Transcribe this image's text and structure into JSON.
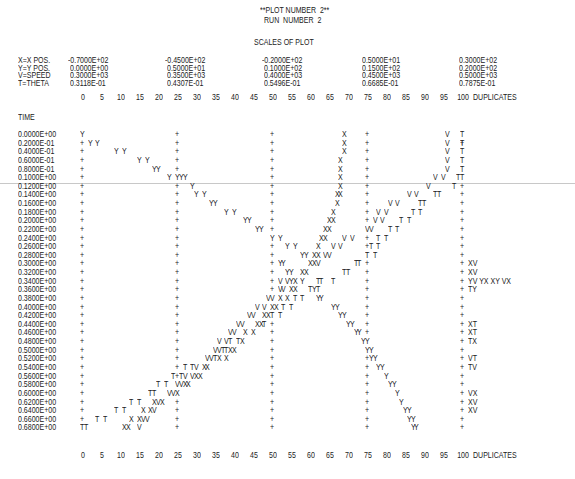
{
  "header": {
    "plot_number": "**PLOT NUMBER  2**",
    "run_number": "RUN  NUMBER  2",
    "scales_title": "SCALES OF PLOT"
  },
  "scales": {
    "variables": [
      "X=X POS.",
      "Y=Y POS.",
      "V=SPEED",
      "T=THETA"
    ],
    "columns": [
      [
        "-0.7000E+02",
        "0.0000E+00",
        "0.3000E+03",
        "0.3118E-01"
      ],
      [
        "-0.4500E+02",
        "0.5000E+01",
        "0.3500E+03",
        "0.4307E-01"
      ],
      [
        "-0.2000E+02",
        "0.1000E+02",
        "0.4000E+03",
        "0.5496E-01"
      ],
      [
        "0.5000E+01",
        "0.1500E+02",
        "0.4500E+03",
        "0.6685E-01"
      ],
      [
        "0.3000E+02",
        "0.2000E+02",
        "0.5000E+03",
        "0.7875E-01"
      ]
    ]
  },
  "axis": {
    "ticks": [
      "0",
      "5",
      "10",
      "15",
      "20",
      "25",
      "30",
      "35",
      "40",
      "45",
      "50",
      "55",
      "60",
      "65",
      "70",
      "75",
      "80",
      "85",
      "90",
      "95",
      "100"
    ],
    "duplicates_label": "DUPLICATES",
    "time_label": "TIME"
  },
  "chart_data": {
    "type": "scatter",
    "xlabel": "plot column (0-100)",
    "ylabel": "TIME",
    "xlim": [
      0,
      100
    ],
    "ylim": [
      0.0,
      0.68
    ],
    "grid_columns": [
      0,
      25,
      50,
      75,
      100
    ],
    "legend": [
      "X=X POS.",
      "Y=Y POS.",
      "V=SPEED",
      "T=THETA"
    ],
    "rows": [
      {
        "time": "0.0000E+00",
        "marks": [
          [
            0,
            "Y"
          ],
          [
            69,
            "X"
          ],
          [
            96,
            "V"
          ],
          [
            100,
            "T"
          ]
        ],
        "dup": ""
      },
      {
        "time": "0.2000E-01",
        "marks": [
          [
            2,
            "Y"
          ],
          [
            4,
            "Y"
          ]
        ],
        "x": 69,
        "v": 96,
        "t": 100,
        "dup": ""
      },
      {
        "time": "0.4000E-01",
        "marks": [
          [
            9,
            "Y"
          ],
          [
            11,
            "Y"
          ],
          [
            69,
            "X"
          ],
          [
            96,
            "V"
          ],
          [
            100,
            "T"
          ]
        ],
        "dup": ""
      },
      {
        "time": "0.6000E-01",
        "marks": [
          [
            15,
            "Y"
          ],
          [
            17,
            "Y"
          ],
          [
            68,
            "X"
          ],
          [
            96,
            "V"
          ],
          [
            100,
            "T"
          ]
        ],
        "dup": ""
      },
      {
        "time": "0.8000E-01",
        "marks": [
          [
            19,
            "YY"
          ],
          [
            68,
            "X"
          ],
          [
            96,
            "V"
          ],
          [
            100,
            "T"
          ]
        ],
        "dup": ""
      },
      {
        "time": "0.1000E+00",
        "marks": [
          [
            23,
            "Y"
          ],
          [
            25,
            "YYY"
          ],
          [
            68,
            "X"
          ],
          [
            93,
            "V"
          ],
          [
            95,
            "V"
          ],
          [
            99,
            "TT"
          ]
        ],
        "dup": ""
      },
      {
        "time": "0.1200E+00",
        "marks": [
          [
            29,
            "Y"
          ],
          [
            68,
            "X"
          ],
          [
            91,
            "V"
          ],
          [
            98,
            "T"
          ]
        ],
        "dup": ""
      },
      {
        "time": "0.1400E+00",
        "marks": [
          [
            30,
            "Y"
          ],
          [
            32,
            "Y"
          ],
          [
            67,
            "XX"
          ],
          [
            86,
            "V"
          ],
          [
            88,
            "V"
          ],
          [
            93,
            "TT"
          ]
        ],
        "dup": ""
      },
      {
        "time": "0.1600E+00",
        "marks": [
          [
            34,
            "YY"
          ],
          [
            67,
            "X"
          ],
          [
            81,
            "V"
          ],
          [
            83,
            "V"
          ],
          [
            89,
            "TT"
          ]
        ],
        "dup": ""
      },
      {
        "time": "0.1800E+00",
        "marks": [
          [
            38,
            "Y"
          ],
          [
            40,
            "Y"
          ],
          [
            66,
            "X"
          ],
          [
            78,
            "V"
          ],
          [
            80,
            "V"
          ],
          [
            87,
            "T"
          ],
          [
            89,
            "T"
          ]
        ],
        "dup": ""
      },
      {
        "time": "0.2000E+00",
        "marks": [
          [
            43,
            "YY"
          ],
          [
            65,
            "XX"
          ],
          [
            77,
            "V"
          ],
          [
            79,
            "V"
          ],
          [
            84,
            "T"
          ],
          [
            86,
            "T"
          ]
        ],
        "dup": ""
      },
      {
        "time": "0.2200E+00",
        "marks": [
          [
            46,
            "YY"
          ],
          [
            64,
            "XX"
          ],
          [
            75,
            "VV"
          ],
          [
            81,
            "T"
          ],
          [
            83,
            "T"
          ]
        ],
        "dup": ""
      },
      {
        "time": "0.2400E+00",
        "marks": [
          [
            50,
            "Y"
          ],
          [
            52,
            "Y"
          ],
          [
            63,
            "XX"
          ],
          [
            69,
            "V"
          ],
          [
            71,
            "V"
          ],
          [
            78,
            "T"
          ],
          [
            80,
            "T"
          ]
        ],
        "dup": ""
      },
      {
        "time": "0.2600E+00",
        "marks": [
          [
            54,
            "Y"
          ],
          [
            56,
            "Y"
          ],
          [
            62,
            "X"
          ],
          [
            66,
            "V"
          ],
          [
            68,
            "V"
          ],
          [
            76,
            "T"
          ],
          [
            78,
            "T"
          ]
        ],
        "dup": ""
      },
      {
        "time": "0.2800E+00",
        "marks": [
          [
            58,
            "YY"
          ],
          [
            61,
            "XX"
          ],
          [
            64,
            "VV"
          ],
          [
            75,
            "T"
          ],
          [
            77,
            "T"
          ]
        ],
        "dup": ""
      },
      {
        "time": "0.3000E+00",
        "marks": [
          [
            52,
            "YY"
          ],
          [
            60,
            "XXV"
          ],
          [
            72,
            "TT"
          ]
        ],
        "dup": "XV"
      },
      {
        "time": "0.3200E+00",
        "marks": [
          [
            54,
            "YY"
          ],
          [
            58,
            "XX"
          ],
          [
            69,
            "TT"
          ]
        ],
        "dup": "XV"
      },
      {
        "time": "0.3400E+00",
        "marks": [
          [
            52,
            "V"
          ],
          [
            54,
            "VYX"
          ],
          [
            58,
            "Y"
          ],
          [
            62,
            "TT"
          ],
          [
            66,
            "T"
          ]
        ],
        "dup": "YV YX XY VX"
      },
      {
        "time": "0.3600E+00",
        "marks": [
          [
            52,
            "VV"
          ],
          [
            55,
            "XX"
          ],
          [
            60,
            "TYT"
          ]
        ],
        "dup": "TY"
      },
      {
        "time": "0.3800E+00",
        "marks": [
          [
            49,
            "VV"
          ],
          [
            52,
            "X"
          ],
          [
            54,
            "X"
          ],
          [
            56,
            "T"
          ],
          [
            58,
            "T"
          ],
          [
            62,
            "YY"
          ]
        ],
        "dup": ""
      },
      {
        "time": "0.4000E+00",
        "marks": [
          [
            46,
            "V"
          ],
          [
            48,
            "V"
          ],
          [
            50,
            "XX"
          ],
          [
            53,
            "T"
          ],
          [
            55,
            "T"
          ],
          [
            66,
            "YY"
          ]
        ],
        "dup": ""
      },
      {
        "time": "0.4200E+00",
        "marks": [
          [
            44,
            "VV"
          ],
          [
            48,
            "XXT"
          ],
          [
            52,
            "T"
          ],
          [
            68,
            "YY"
          ]
        ],
        "dup": ""
      },
      {
        "time": "0.4400E+00",
        "marks": [
          [
            41,
            "VV"
          ],
          [
            46,
            "XXT"
          ],
          [
            70,
            "YY"
          ]
        ],
        "dup": "XT"
      },
      {
        "time": "0.4600E+00",
        "marks": [
          [
            39,
            "VV"
          ],
          [
            43,
            "X"
          ],
          [
            45,
            "X"
          ],
          [
            72,
            "YY"
          ]
        ],
        "dup": "XT"
      },
      {
        "time": "0.4800E+00",
        "marks": [
          [
            36,
            "V"
          ],
          [
            38,
            "VT"
          ],
          [
            41,
            "TX"
          ],
          [
            74,
            "YY"
          ]
        ],
        "dup": "TX"
      },
      {
        "time": "0.5000E+00",
        "marks": [
          [
            35,
            "VVTTXX"
          ],
          [
            75,
            "YY"
          ]
        ],
        "dup": ""
      },
      {
        "time": "0.5200E+00",
        "marks": [
          [
            33,
            "VVTX"
          ],
          [
            38,
            "X"
          ],
          [
            76,
            "YY"
          ]
        ],
        "dup": "VT"
      },
      {
        "time": "0.5400E+00",
        "marks": [
          [
            27,
            "T"
          ],
          [
            29,
            "TV"
          ],
          [
            32,
            "XX"
          ],
          [
            78,
            "YY"
          ]
        ],
        "dup": "TV"
      },
      {
        "time": "0.5600E+00",
        "marks": [
          [
            24,
            "T"
          ],
          [
            26,
            "TV"
          ],
          [
            29,
            "VXX"
          ],
          [
            80,
            "Y"
          ]
        ],
        "dup": ""
      },
      {
        "time": "0.5800E+00",
        "marks": [
          [
            20,
            "T"
          ],
          [
            22,
            "T"
          ],
          [
            25,
            "VVXX"
          ],
          [
            81,
            "YY"
          ]
        ],
        "dup": ""
      },
      {
        "time": "0.6000E+00",
        "marks": [
          [
            18,
            "TT"
          ],
          [
            23,
            "VVX"
          ],
          [
            83,
            "Y"
          ]
        ],
        "dup": "VX"
      },
      {
        "time": "0.6200E+00",
        "marks": [
          [
            13,
            "T"
          ],
          [
            15,
            "T"
          ],
          [
            19,
            "XVX"
          ],
          [
            84,
            "Y"
          ]
        ],
        "dup": "XV"
      },
      {
        "time": "0.6400E+00",
        "marks": [
          [
            9,
            "T"
          ],
          [
            11,
            "T"
          ],
          [
            16,
            "X"
          ],
          [
            18,
            "XV"
          ],
          [
            85,
            "YY"
          ]
        ],
        "dup": "XV"
      },
      {
        "time": "0.6600E+00",
        "marks": [
          [
            4,
            "T"
          ],
          [
            6,
            "T"
          ],
          [
            13,
            "X"
          ],
          [
            15,
            "XVV"
          ],
          [
            86,
            "YY"
          ]
        ],
        "dup": ""
      },
      {
        "time": "0.6800E+00",
        "marks": [
          [
            0,
            "TT"
          ],
          [
            11,
            "XX"
          ],
          [
            15,
            "V"
          ],
          [
            87,
            "YY"
          ]
        ],
        "dup": ""
      }
    ]
  }
}
